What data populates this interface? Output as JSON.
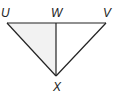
{
  "diagram": {
    "type": "triangle",
    "points": {
      "U": {
        "label": "U",
        "x": 7,
        "y": 23
      },
      "W": {
        "label": "W",
        "x": 56,
        "y": 23
      },
      "V": {
        "label": "V",
        "x": 106,
        "y": 23
      },
      "X": {
        "label": "X",
        "x": 56,
        "y": 76
      }
    },
    "segments": [
      "UV",
      "UX",
      "VX",
      "WX"
    ],
    "colors": {
      "stroke": "#222222",
      "shade": "#e6e6e6"
    }
  }
}
